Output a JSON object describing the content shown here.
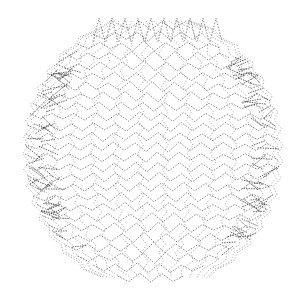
{
  "figure": {
    "width": 306,
    "height": 288,
    "center": [
      153,
      152
    ],
    "radius_x": 128,
    "radius_y": 138,
    "stroke_color": "#333333",
    "background": "#ffffff",
    "latitude_bands": 26,
    "longitude_bands": 16,
    "zigzag_amplitude": 8,
    "zigzag_period": 22
  }
}
